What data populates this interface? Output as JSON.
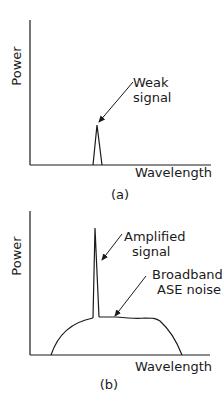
{
  "panels": [
    {
      "id": "a",
      "caption": "(a)",
      "y_axis_label": "Power",
      "x_axis_label": "Wavelength",
      "annotations": [
        {
          "lines": [
            "Weak",
            "signal"
          ],
          "target": "narrow low peak"
        }
      ]
    },
    {
      "id": "b",
      "caption": "(b)",
      "y_axis_label": "Power",
      "x_axis_label": "Wavelength",
      "annotations": [
        {
          "lines": [
            "Amplified",
            "signal"
          ],
          "target": "tall narrow spike"
        },
        {
          "lines": [
            "Broadband",
            "ASE noise"
          ],
          "target": "broad plateau curve"
        }
      ]
    }
  ],
  "colors": {
    "line": "#1a1a1a",
    "background": "#ffffff"
  }
}
